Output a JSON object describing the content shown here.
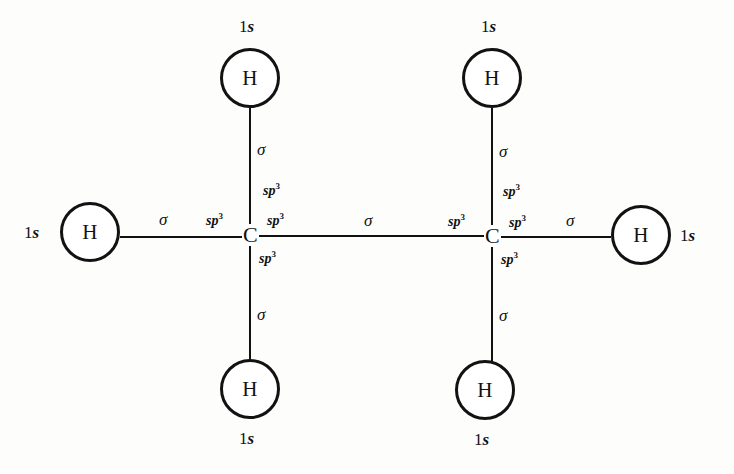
{
  "diagram": {
    "type": "molecular-orbital-bonding-diagram",
    "molecule": "C2H6",
    "ink_color": "#111111",
    "background_color": "#fdfdfc",
    "atoms": [
      {
        "id": "h-top-left",
        "element": "H",
        "orbital": "1s",
        "x": 250,
        "y": 78
      },
      {
        "id": "h-top-right",
        "element": "H",
        "orbital": "1s",
        "x": 492,
        "y": 78
      },
      {
        "id": "h-left",
        "element": "H",
        "orbital": "1s",
        "x": 90,
        "y": 232
      },
      {
        "id": "h-right",
        "element": "H",
        "orbital": "1s",
        "x": 641,
        "y": 235
      },
      {
        "id": "h-bottom-left",
        "element": "H",
        "orbital": "1s",
        "x": 250,
        "y": 389
      },
      {
        "id": "h-bottom-right",
        "element": "H",
        "orbital": "1s",
        "x": 485,
        "y": 390
      },
      {
        "id": "c-left",
        "element": "C",
        "orbital": "sp3",
        "x": 250,
        "y": 235
      },
      {
        "id": "c-right",
        "element": "C",
        "orbital": "sp3",
        "x": 492,
        "y": 236
      }
    ],
    "bonds": [
      {
        "id": "bond-c-left-h-top",
        "type": "sigma",
        "label": "σ"
      },
      {
        "id": "bond-c-left-h-bottom",
        "type": "sigma",
        "label": "σ"
      },
      {
        "id": "bond-c-left-h-left",
        "type": "sigma",
        "label": "σ"
      },
      {
        "id": "bond-c-c",
        "type": "sigma",
        "label": "σ"
      },
      {
        "id": "bond-c-right-h-top",
        "type": "sigma",
        "label": "σ"
      },
      {
        "id": "bond-c-right-h-bottom",
        "type": "sigma",
        "label": "σ"
      },
      {
        "id": "bond-c-right-h-right",
        "type": "sigma",
        "label": "σ"
      }
    ],
    "labels": {
      "hydrogen_symbol": "H",
      "carbon_symbol": "C",
      "orbital_1s_prefix": "1",
      "orbital_1s_suffix": "s",
      "sigma": "σ",
      "sp_base": "sp",
      "sp_exponent": "3"
    }
  }
}
